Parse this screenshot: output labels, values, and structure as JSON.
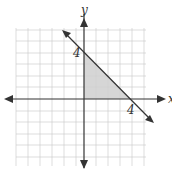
{
  "figure": {
    "type": "coordinate-plane-graph",
    "axes": {
      "x_label": "x",
      "y_label": "y"
    },
    "grid": {
      "min": -6,
      "max": 6,
      "unit_px": 12
    },
    "line": {
      "description": "line through (0,4) and (4,0)",
      "equation": "x + y = 4"
    },
    "shaded_region": {
      "vertices": [
        [
          0,
          0
        ],
        [
          0,
          4
        ],
        [
          4,
          0
        ]
      ],
      "color": "#cfcfcf"
    },
    "tick_labels": [
      {
        "axis": "y",
        "value": "4"
      },
      {
        "axis": "x",
        "value": "4"
      }
    ]
  }
}
